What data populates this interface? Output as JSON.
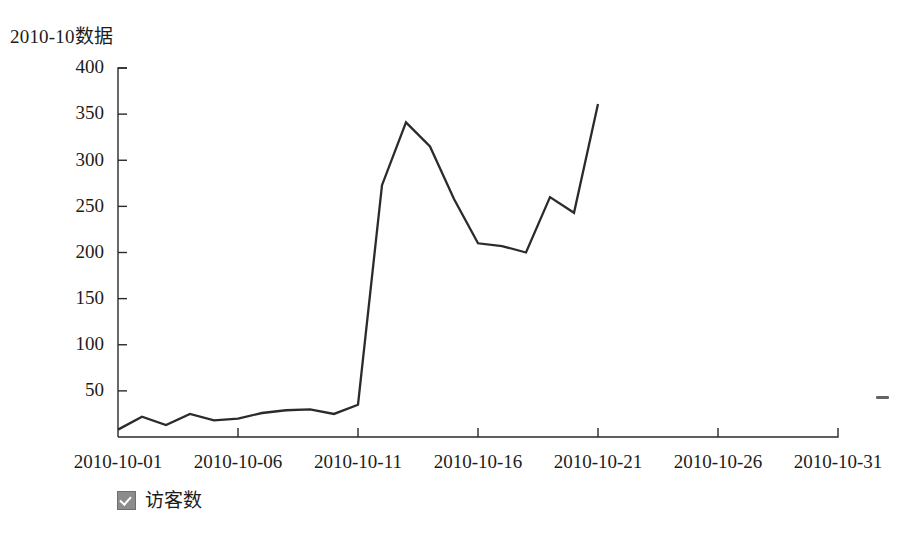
{
  "title": "2010-10数据",
  "legend": {
    "checkbox_icon": "checked-checkbox-icon",
    "label": "访客数",
    "checked": true
  },
  "artifact": {
    "name": "scan-artifact-dash"
  },
  "chart_data": {
    "type": "line",
    "title": "2010-10数据",
    "xlabel": "",
    "ylabel": "",
    "grid": false,
    "legend_position": "bottom-left",
    "series": [
      {
        "name": "访客数",
        "color": "#2b2b2b",
        "x": [
          "2010-10-01",
          "2010-10-02",
          "2010-10-03",
          "2010-10-04",
          "2010-10-05",
          "2010-10-06",
          "2010-10-07",
          "2010-10-08",
          "2010-10-09",
          "2010-10-10",
          "2010-10-11",
          "2010-10-12",
          "2010-10-13",
          "2010-10-14",
          "2010-10-15",
          "2010-10-16",
          "2010-10-17",
          "2010-10-18",
          "2010-10-19",
          "2010-10-20",
          "2010-10-21"
        ],
        "values": [
          8,
          22,
          13,
          25,
          18,
          20,
          26,
          29,
          30,
          25,
          35,
          273,
          341,
          315,
          258,
          210,
          207,
          200,
          260,
          243,
          361
        ]
      }
    ],
    "x_tick_labels": [
      "2010-10-01",
      "2010-10-06",
      "2010-10-11",
      "2010-10-16",
      "2010-10-21",
      "2010-10-26",
      "2010-10-31"
    ],
    "x_tick_days": [
      1,
      6,
      11,
      16,
      21,
      26,
      31
    ],
    "xlim_days": [
      1,
      31
    ],
    "y_tick_labels": [
      "50",
      "100",
      "150",
      "200",
      "250",
      "300",
      "350",
      "400"
    ],
    "y_tick_values": [
      50,
      100,
      150,
      200,
      250,
      300,
      350,
      400
    ],
    "ylim": [
      0,
      400
    ]
  }
}
